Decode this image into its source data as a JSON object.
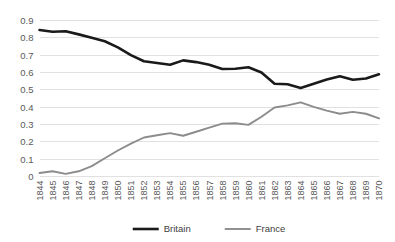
{
  "chart_data": {
    "type": "line",
    "title": "",
    "xlabel": "",
    "ylabel": "",
    "ylim": [
      0,
      0.9
    ],
    "ytick_labels": [
      "0.9",
      "0.8",
      "0.7",
      "0.6",
      "0.5",
      "0.4",
      "0.3",
      "0.2",
      "0.1",
      "0"
    ],
    "ytick_values": [
      0.9,
      0.8,
      0.7,
      0.6,
      0.5,
      0.4,
      0.3,
      0.2,
      0.1,
      0
    ],
    "grid": true,
    "grid_axis": "y",
    "legend_position": "bottom",
    "categories": [
      "1844",
      "1845",
      "1846",
      "1847",
      "1848",
      "1849",
      "1850",
      "1851",
      "1852",
      "1853",
      "1854",
      "1855",
      "1856",
      "1857",
      "1858",
      "1859",
      "1860",
      "1861",
      "1862",
      "1863",
      "1864",
      "1865",
      "1866",
      "1867",
      "1868",
      "1869",
      "1870"
    ],
    "series": [
      {
        "name": "Britain",
        "color": "#1a1a1a",
        "line_width": 2.6,
        "values": [
          0.845,
          0.835,
          0.838,
          0.82,
          0.8,
          0.78,
          0.745,
          0.7,
          0.665,
          0.655,
          0.645,
          0.67,
          0.66,
          0.645,
          0.62,
          0.622,
          0.63,
          0.6,
          0.535,
          0.532,
          0.51,
          0.535,
          0.56,
          0.578,
          0.558,
          0.565,
          0.59
        ]
      },
      {
        "name": "France",
        "color": "#8c8c8c",
        "line_width": 1.9,
        "values": [
          0.02,
          0.03,
          0.015,
          0.03,
          0.06,
          0.105,
          0.15,
          0.19,
          0.225,
          0.238,
          0.25,
          0.235,
          0.258,
          0.282,
          0.305,
          0.307,
          0.298,
          0.345,
          0.398,
          0.41,
          0.428,
          0.402,
          0.38,
          0.362,
          0.373,
          0.362,
          0.335
        ]
      }
    ]
  },
  "legend": {
    "items": [
      {
        "label": "Britain"
      },
      {
        "label": "France"
      }
    ]
  },
  "colors": {
    "britain": "#1a1a1a",
    "france": "#8c8c8c",
    "gridline": "#d9d9d9",
    "tick_text": "#595959",
    "background": "#ffffff"
  }
}
